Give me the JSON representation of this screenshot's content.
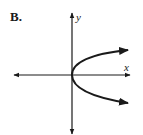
{
  "figure": {
    "option_label": "B.",
    "x_axis_label": "x",
    "y_axis_label": "y",
    "curve_description": "Parabola opening to the right with vertex at origin",
    "colors": {
      "stroke": "#1a1a1a",
      "background": "#ffffff"
    }
  }
}
